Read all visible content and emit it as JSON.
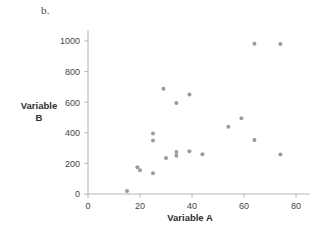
{
  "figure": {
    "panel_letter": "b.",
    "background_color": "#ffffff",
    "point_color": "#9b9b9b",
    "axis_color": "#b8b8b8"
  },
  "chart_data": {
    "type": "scatter",
    "title": "",
    "panel_label": "b.",
    "xlabel": "Variable A",
    "ylabel": "Variable B",
    "xlim": [
      0,
      85
    ],
    "ylim": [
      0,
      1060
    ],
    "xticks": [
      0,
      20,
      40,
      60,
      80
    ],
    "yticks": [
      0,
      200,
      400,
      600,
      800,
      1000
    ],
    "xticklabels": [
      "0",
      "20",
      "40",
      "60",
      "80"
    ],
    "yticklabels": [
      "0",
      "200",
      "400",
      "600",
      "800",
      "1000"
    ],
    "grid": false,
    "legend": false,
    "marker": "circle",
    "marker_color": "#9b9b9b",
    "points": [
      {
        "x": 15,
        "y": 20
      },
      {
        "x": 19,
        "y": 175
      },
      {
        "x": 20,
        "y": 155
      },
      {
        "x": 25,
        "y": 135
      },
      {
        "x": 25,
        "y": 350
      },
      {
        "x": 25,
        "y": 395
      },
      {
        "x": 29,
        "y": 688
      },
      {
        "x": 30,
        "y": 235
      },
      {
        "x": 34,
        "y": 595
      },
      {
        "x": 34,
        "y": 250
      },
      {
        "x": 34,
        "y": 275
      },
      {
        "x": 39,
        "y": 650
      },
      {
        "x": 39,
        "y": 280
      },
      {
        "x": 44,
        "y": 260
      },
      {
        "x": 54,
        "y": 440
      },
      {
        "x": 59,
        "y": 495
      },
      {
        "x": 64,
        "y": 353
      },
      {
        "x": 64,
        "y": 982
      },
      {
        "x": 74,
        "y": 258
      },
      {
        "x": 74,
        "y": 980
      }
    ]
  }
}
